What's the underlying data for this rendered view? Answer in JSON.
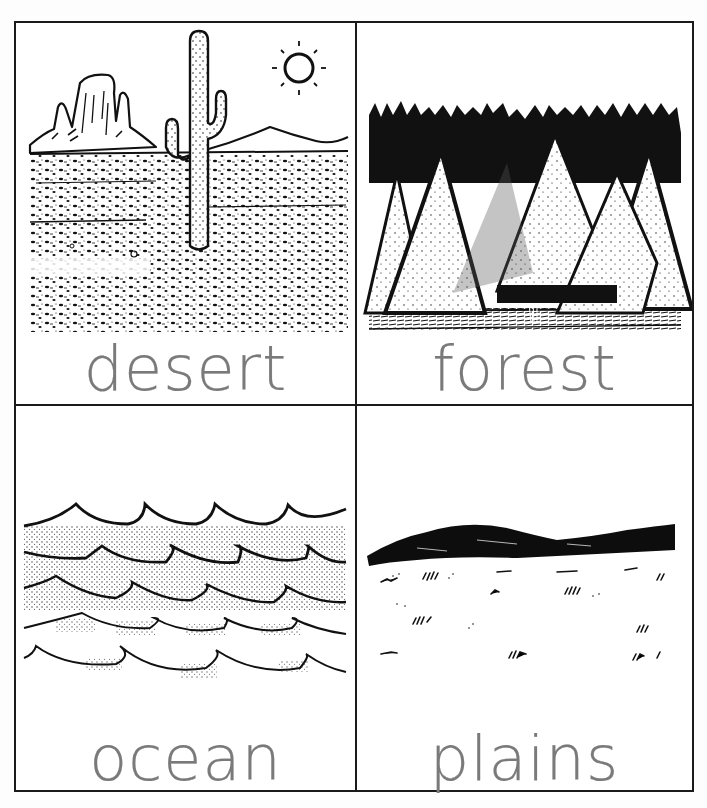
{
  "worksheet": {
    "title": "Biomes picture cards",
    "line_color": "#1a1a1a",
    "label_color": "#7a7a7a",
    "cards": [
      {
        "id": "desert",
        "label": "desert",
        "illustration": "desert-scene",
        "elements": [
          "sun",
          "saguaro cactus",
          "mesa rock formation",
          "distant hill",
          "speckled sand"
        ]
      },
      {
        "id": "forest",
        "label": "forest",
        "illustration": "forest-scene",
        "elements": [
          "conifer trees",
          "dark background treeline",
          "grassy ground"
        ]
      },
      {
        "id": "ocean",
        "label": "ocean",
        "illustration": "ocean-scene",
        "elements": [
          "rows of stippled waves"
        ]
      },
      {
        "id": "plains",
        "label": "plains",
        "illustration": "plains-scene",
        "elements": [
          "dark rolling hill",
          "grass tufts"
        ]
      }
    ]
  }
}
